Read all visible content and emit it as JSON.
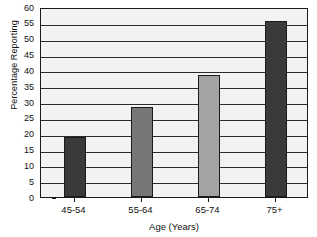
{
  "chart_data": {
    "type": "bar",
    "title": "",
    "subtitle": "",
    "xlabel": "Age (Years)",
    "ylabel": "Percentage Reporting",
    "categories": [
      "45-54",
      "55-64",
      "65-74",
      "75+"
    ],
    "values": [
      19,
      28.5,
      38.5,
      55.5
    ],
    "series": [
      {
        "name": "Percentage Reporting",
        "values": [
          19,
          28.5,
          38.5,
          55.5
        ]
      }
    ],
    "ylim": [
      0,
      60
    ],
    "y_ticks": [
      0,
      5,
      10,
      15,
      20,
      25,
      30,
      35,
      40,
      45,
      50,
      55,
      60
    ],
    "y_tick_labels": [
      "0",
      "5",
      "10",
      "15",
      "20",
      "25",
      "30",
      "35",
      "40",
      "45",
      "50",
      "55",
      "60"
    ],
    "x_tick_labels": [
      "45-54",
      "55-64",
      "65-74",
      "75+"
    ],
    "grid": true,
    "grid_axis": "y",
    "legend": false,
    "legend_position": "none",
    "annotations": [],
    "bar_colors": [
      "#3a3a3a",
      "#767676",
      "#a3a3a3",
      "#3a3a3a"
    ],
    "plot_background": "#f2f2f2",
    "grid_color": "#2b2b2b",
    "axis_color": "#1a1a1a",
    "text_color": "#111111"
  }
}
